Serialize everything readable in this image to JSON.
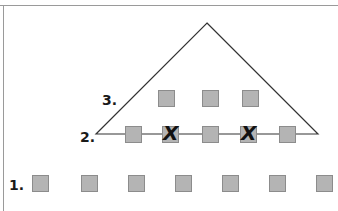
{
  "diagram": {
    "colors": {
      "box_fill": "#b4b4b4",
      "box_border": "#8c8c8c",
      "line": "#333333",
      "label": "#1a1a1a",
      "frame": "#9a9a9a"
    },
    "triangle": {
      "apex": [
        207,
        23
      ],
      "base_left": [
        96,
        134
      ],
      "base_right": [
        318,
        134
      ]
    },
    "rows": [
      {
        "label": "1.",
        "label_pos": [
          9,
          178
        ],
        "boxes": [
          {
            "x": 32,
            "y": 175,
            "crossed": false
          },
          {
            "x": 81,
            "y": 175,
            "crossed": false
          },
          {
            "x": 128,
            "y": 175,
            "crossed": false
          },
          {
            "x": 175,
            "y": 175,
            "crossed": false
          },
          {
            "x": 222,
            "y": 175,
            "crossed": false
          },
          {
            "x": 269,
            "y": 175,
            "crossed": false
          },
          {
            "x": 316,
            "y": 175,
            "crossed": false
          }
        ]
      },
      {
        "label": "2.",
        "label_pos": [
          80,
          130
        ],
        "boxes": [
          {
            "x": 125,
            "y": 126,
            "crossed": false
          },
          {
            "x": 162,
            "y": 126,
            "crossed": true
          },
          {
            "x": 202,
            "y": 126,
            "crossed": false
          },
          {
            "x": 240,
            "y": 126,
            "crossed": true
          },
          {
            "x": 279,
            "y": 126,
            "crossed": false
          }
        ]
      },
      {
        "label": "3.",
        "label_pos": [
          102,
          93
        ],
        "boxes": [
          {
            "x": 158,
            "y": 90,
            "crossed": false
          },
          {
            "x": 202,
            "y": 90,
            "crossed": false
          },
          {
            "x": 242,
            "y": 90,
            "crossed": false
          }
        ]
      }
    ],
    "cross_glyph": "X"
  }
}
